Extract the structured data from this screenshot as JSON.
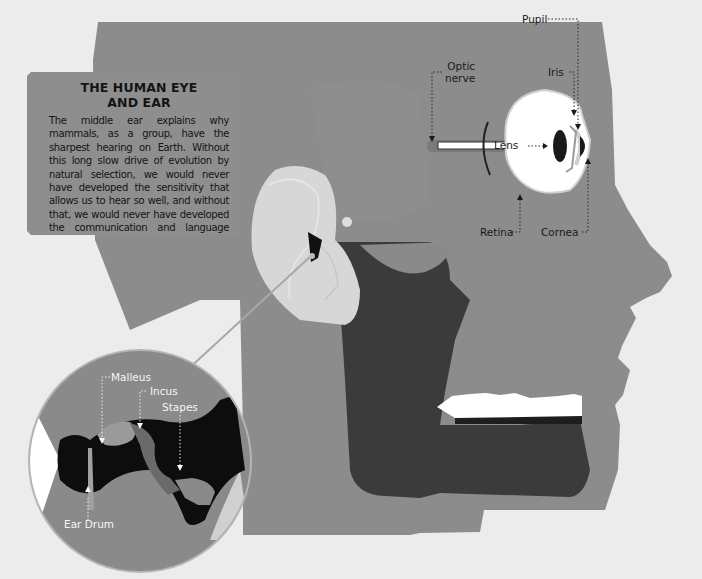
{
  "infobox": {
    "title_line1": "THE HUMAN EYE",
    "title_line2": "AND EAR",
    "body": "The middle ear explains why mammals, as a group, have the sharpest hearing on Earth. Without this long slow drive of evolution by natural selection, we would never have developed the sensitivity that allows us to hear so well, and without that, we would never have developed the communication and language skills that are among our most human of abilities."
  },
  "eye_labels": {
    "optic_nerve_line1": "Optic",
    "optic_nerve_line2": "nerve",
    "pupil": "Pupil",
    "iris": "Iris",
    "lens": "Lens",
    "retina": "Retina",
    "cornea": "Cornea"
  },
  "ear_labels": {
    "malleus": "Malleus",
    "incus": "Incus",
    "stapes": "Stapes",
    "ear_drum": "Ear Drum"
  },
  "colors": {
    "background": "#ececec",
    "head": "#8c8c8c",
    "dark_cavity": "#3a3a3a",
    "ear": "#d8d8d8",
    "eye_white": "#ffffff",
    "text_dark": "#141414",
    "text_light": "#f5f5f5"
  }
}
